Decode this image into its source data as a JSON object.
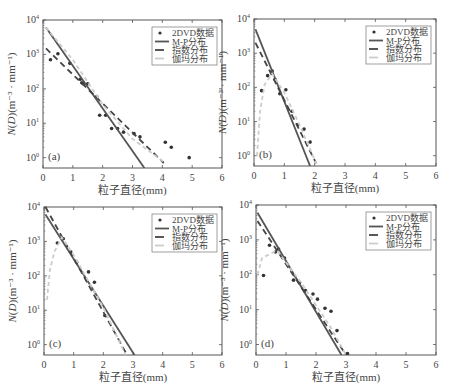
{
  "chart_data": [
    {
      "type": "line",
      "panel": "(a)",
      "xlabel": "粒子直径(mm)",
      "ylabel": "N(D)(m⁻³·mm⁻¹)",
      "xlim": [
        0,
        6
      ],
      "ylim": [
        0.5,
        10000
      ],
      "yscale": "log",
      "xticks": [
        "0",
        "1",
        "2",
        "3",
        "4",
        "5",
        "6"
      ],
      "yticks": [
        "10^0",
        "10^1",
        "10^2",
        "10^3",
        "10^4"
      ],
      "legend": [
        "2DVD数据",
        "M-P分布",
        "指数分布",
        "伽玛分布"
      ],
      "legend_position": "upper right",
      "series": [
        {
          "name": "2DVD数据",
          "style": "scatter",
          "points": [
            [
              0.25,
              700
            ],
            [
              0.5,
              1050
            ],
            [
              0.9,
              550
            ],
            [
              1.25,
              190
            ],
            [
              1.3,
              150
            ],
            [
              1.35,
              140
            ],
            [
              1.5,
              140
            ],
            [
              1.8,
              60
            ],
            [
              1.9,
              17
            ],
            [
              2.1,
              17
            ],
            [
              2.3,
              7
            ],
            [
              2.5,
              7
            ],
            [
              2.7,
              5.5
            ],
            [
              3.05,
              5
            ],
            [
              3.25,
              4
            ],
            [
              4.1,
              2.8
            ],
            [
              4.3,
              2
            ],
            [
              4.9,
              1
            ]
          ]
        },
        {
          "name": "M-P分布",
          "style": "solid",
          "points": [
            [
              0.1,
              6000
            ],
            [
              3.4,
              0.5
            ]
          ]
        },
        {
          "name": "指数分布",
          "style": "dashed",
          "points": [
            [
              0.1,
              1500
            ],
            [
              4.05,
              0.7
            ]
          ]
        },
        {
          "name": "伽玛分布",
          "style": "light-dashed",
          "points": [
            [
              0.1,
              6000
            ],
            [
              1,
              700
            ],
            [
              2,
              35
            ],
            [
              3,
              3.5
            ],
            [
              4.1,
              0.7
            ]
          ]
        }
      ]
    },
    {
      "type": "line",
      "panel": "(b)",
      "xlabel": "粒子直径(mm)",
      "ylabel": "N(D)(m⁻³·mm⁻¹)",
      "xlim": [
        0,
        6
      ],
      "ylim": [
        0.5,
        10000
      ],
      "yscale": "log",
      "xticks": [
        "0",
        "1",
        "2",
        "3",
        "4",
        "5",
        "6"
      ],
      "yticks": [
        "10^0",
        "10^1",
        "10^2",
        "10^3",
        "10^4"
      ],
      "legend": [
        "2DVD数据",
        "M-P分布",
        "指数分布",
        "伽玛分布"
      ],
      "legend_position": "upper right",
      "series": [
        {
          "name": "2DVD数据",
          "style": "scatter",
          "points": [
            [
              0.25,
              80
            ],
            [
              0.45,
              220
            ],
            [
              0.6,
              300
            ],
            [
              0.7,
              170
            ],
            [
              0.85,
              65
            ],
            [
              1.05,
              85
            ],
            [
              1.25,
              20
            ],
            [
              1.45,
              8
            ],
            [
              1.65,
              6
            ],
            [
              1.85,
              2.5
            ]
          ]
        },
        {
          "name": "M-P分布",
          "style": "solid",
          "points": [
            [
              0.05,
              5000
            ],
            [
              1.85,
              0.5
            ]
          ]
        },
        {
          "name": "指数分布",
          "style": "dashed",
          "points": [
            [
              0.05,
              2000
            ],
            [
              2.05,
              0.6
            ]
          ]
        },
        {
          "name": "伽玛分布",
          "style": "light-dashed",
          "points": [
            [
              0.1,
              1
            ],
            [
              0.2,
              20
            ],
            [
              0.35,
              120
            ],
            [
              0.6,
              250
            ],
            [
              1,
              70
            ],
            [
              1.5,
              8
            ],
            [
              2.05,
              0.6
            ]
          ]
        }
      ]
    },
    {
      "type": "line",
      "panel": "(c)",
      "xlabel": "粒子直径(mm)",
      "ylabel": "N(D)(m⁻³·mm⁻¹)",
      "xlim": [
        0,
        6
      ],
      "ylim": [
        0.5,
        10000
      ],
      "yscale": "log",
      "xticks": [
        "0",
        "1",
        "2",
        "3",
        "4",
        "5",
        "6"
      ],
      "yticks": [
        "10^0",
        "10^1",
        "10^2",
        "10^3",
        "10^4"
      ],
      "legend": [
        "2DVD数据",
        "M-P分布",
        "指数分布",
        "伽玛分布"
      ],
      "legend_position": "upper right",
      "series": [
        {
          "name": "2DVD数据",
          "style": "scatter",
          "points": [
            [
              0.45,
              900
            ],
            [
              0.65,
              1200
            ],
            [
              0.9,
              500
            ],
            [
              1.1,
              250
            ],
            [
              1.5,
              130
            ],
            [
              1.7,
              65
            ],
            [
              2.05,
              7
            ]
          ]
        },
        {
          "name": "M-P分布",
          "style": "solid",
          "points": [
            [
              0.05,
              6000
            ],
            [
              3.05,
              0.5
            ]
          ]
        },
        {
          "name": "指数分布",
          "style": "dashed",
          "points": [
            [
              0.05,
              10000
            ],
            [
              2.8,
              0.5
            ]
          ]
        },
        {
          "name": "伽玛分布",
          "style": "light-dashed",
          "points": [
            [
              0.1,
              20
            ],
            [
              0.2,
              150
            ],
            [
              0.35,
              500
            ],
            [
              0.6,
              1300
            ],
            [
              1,
              400
            ],
            [
              2,
              12
            ],
            [
              2.75,
              0.5
            ]
          ]
        }
      ]
    },
    {
      "type": "line",
      "panel": "(d)",
      "xlabel": "粒子直径(mm)",
      "ylabel": "N(D)(m⁻³·mm⁻¹)",
      "xlim": [
        0,
        6
      ],
      "ylim": [
        0.5,
        10000
      ],
      "yscale": "log",
      "xticks": [
        "0",
        "1",
        "2",
        "3",
        "4",
        "5",
        "6"
      ],
      "yticks": [
        "10^0",
        "10^1",
        "10^2",
        "10^3",
        "10^4"
      ],
      "legend": [
        "2DVD数据",
        "M-P分布",
        "指数分布",
        "伽玛分布"
      ],
      "legend_position": "upper right",
      "series": [
        {
          "name": "2DVD数据",
          "style": "scatter",
          "points": [
            [
              0.25,
              95
            ],
            [
              0.45,
              700
            ],
            [
              0.65,
              450
            ],
            [
              0.75,
              550
            ],
            [
              0.95,
              300
            ],
            [
              1.25,
              70
            ],
            [
              1.45,
              60
            ],
            [
              1.65,
              35
            ],
            [
              1.9,
              28
            ],
            [
              2.05,
              20
            ],
            [
              2.3,
              11
            ],
            [
              2.5,
              9
            ],
            [
              2.7,
              2.5
            ],
            [
              3.05,
              0.55
            ]
          ]
        },
        {
          "name": "M-P分布",
          "style": "solid",
          "points": [
            [
              0.05,
              6000
            ],
            [
              2.85,
              0.5
            ]
          ]
        },
        {
          "name": "指数分布",
          "style": "dashed",
          "points": [
            [
              0.05,
              3500
            ],
            [
              3.0,
              0.5
            ]
          ]
        },
        {
          "name": "伽玛分布",
          "style": "light-dashed",
          "points": [
            [
              0.05,
              100
            ],
            [
              0.2,
              300
            ],
            [
              0.7,
              500
            ],
            [
              1.5,
              60
            ],
            [
              2.5,
              3
            ],
            [
              3.0,
              0.5
            ]
          ]
        }
      ]
    }
  ],
  "figure": {
    "panels": [
      {
        "id": "a",
        "label": "(a)",
        "frame": {
          "x": 43,
          "y": 20,
          "w": 179,
          "h": 148
        }
      },
      {
        "id": "b",
        "label": "(b)",
        "frame": {
          "x": 254,
          "y": 19,
          "w": 182,
          "h": 147
        }
      },
      {
        "id": "c",
        "label": "(c)",
        "frame": {
          "x": 44,
          "y": 207,
          "w": 178,
          "h": 148
        }
      },
      {
        "id": "d",
        "label": "(d)",
        "frame": {
          "x": 256,
          "y": 205,
          "w": 180,
          "h": 150
        }
      }
    ],
    "xlabel": "粒子直径(mm)",
    "ylabel_prefix": "N(D)",
    "ylabel_units": "(m⁻³ · mm⁻¹)",
    "colors": {
      "data": "#333333",
      "mp": "#555555",
      "exp": "#444444",
      "gamma": "#cccccc",
      "frame": "#555555"
    }
  }
}
